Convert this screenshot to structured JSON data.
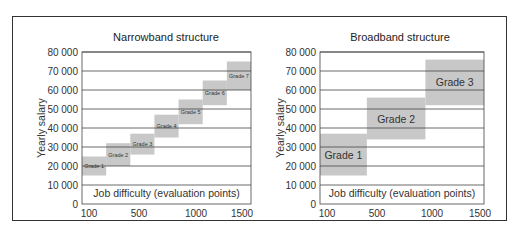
{
  "chart_data": [
    {
      "type": "bar",
      "title": "Narrowband structure",
      "xlabel": "Job difficulty (evaluation points)",
      "ylabel": "Yearly salary",
      "x_ticks": [
        "100",
        "500",
        "1000",
        "1500"
      ],
      "y_ticks": [
        "0",
        "10 000",
        "20 000",
        "30 000",
        "40 000",
        "50 000",
        "60 000",
        "70 000",
        "80 000"
      ],
      "xlim": [
        100,
        1500
      ],
      "ylim": [
        0,
        80000
      ],
      "grid": "horizontal",
      "grades": [
        {
          "name": "Grade 1",
          "x_range": [
            100,
            300
          ],
          "salary_range": [
            15000,
            25000
          ]
        },
        {
          "name": "Grade 2",
          "x_range": [
            300,
            500
          ],
          "salary_range": [
            20000,
            32000
          ]
        },
        {
          "name": "Grade 3",
          "x_range": [
            500,
            700
          ],
          "salary_range": [
            26000,
            37000
          ]
        },
        {
          "name": "Grade 4",
          "x_range": [
            700,
            900
          ],
          "salary_range": [
            35000,
            47000
          ]
        },
        {
          "name": "Grade 5",
          "x_range": [
            900,
            1100
          ],
          "salary_range": [
            42000,
            55000
          ]
        },
        {
          "name": "Grade 6",
          "x_range": [
            1100,
            1300
          ],
          "salary_range": [
            52000,
            65000
          ]
        },
        {
          "name": "Grade 7",
          "x_range": [
            1300,
            1500
          ],
          "salary_range": [
            60000,
            75000
          ]
        }
      ]
    },
    {
      "type": "bar",
      "title": "Broadband structure",
      "xlabel": "Job difficulty (evaluation points)",
      "ylabel": "Yearly salary",
      "x_ticks": [
        "100",
        "500",
        "1000",
        "1500"
      ],
      "y_ticks": [
        "0",
        "10 000",
        "20 000",
        "30 000",
        "40 000",
        "50 000",
        "60 000",
        "70 000",
        "80 000"
      ],
      "xlim": [
        100,
        1500
      ],
      "ylim": [
        0,
        80000
      ],
      "grid": "horizontal",
      "grades": [
        {
          "name": "Grade 1",
          "x_range": [
            100,
            500
          ],
          "salary_range": [
            15000,
            37000
          ]
        },
        {
          "name": "Grade 2",
          "x_range": [
            500,
            1000
          ],
          "salary_range": [
            34000,
            56000
          ]
        },
        {
          "name": "Grade 3",
          "x_range": [
            1000,
            1500
          ],
          "salary_range": [
            52000,
            76000
          ]
        }
      ]
    }
  ],
  "colors": {
    "grade_fill": "#c8c8c8",
    "grid": "#444444",
    "text": "#333333"
  }
}
